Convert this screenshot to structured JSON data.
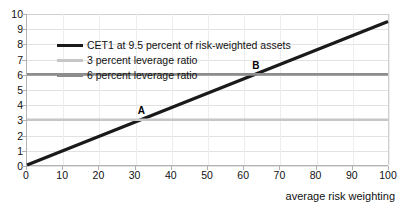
{
  "chart_data": {
    "type": "line",
    "title": "",
    "xlabel": "average risk weighting",
    "ylabel": "",
    "xlim": [
      0,
      100
    ],
    "ylim": [
      0,
      10
    ],
    "xticks": [
      0,
      10,
      20,
      30,
      40,
      50,
      60,
      70,
      80,
      90,
      100
    ],
    "yticks": [
      0,
      1,
      2,
      3,
      4,
      5,
      6,
      7,
      8,
      9,
      10
    ],
    "xtick_labels": [
      "0",
      "10",
      "20",
      "30",
      "40",
      "50",
      "60",
      "70",
      "80",
      "90",
      "100"
    ],
    "ytick_labels": [
      "0",
      "1",
      "2",
      "3",
      "4",
      "5",
      "6",
      "7",
      "8",
      "9",
      "10"
    ],
    "grid": true,
    "legend_position": "upper-left",
    "series": [
      {
        "name": "CET1 at 9.5 percent of risk-weighted assets",
        "color": "#1a1a1a",
        "width": 3.2,
        "kind": "diagonal",
        "slope": 0.095,
        "intercept": 0,
        "x": [
          0,
          100
        ],
        "values": [
          0,
          9.5
        ]
      },
      {
        "name": "3 percent leverage ratio",
        "color": "#c6c6c6",
        "width": 2.6,
        "kind": "horizontal",
        "level": 3,
        "x": [
          0,
          100
        ],
        "values": [
          3,
          3
        ]
      },
      {
        "name": "6 percent leverage ratio",
        "color": "#8d8d8d",
        "width": 2.6,
        "kind": "horizontal",
        "level": 6,
        "x": [
          0,
          100
        ],
        "values": [
          6,
          6
        ]
      }
    ],
    "annotations": [
      {
        "label": "A",
        "x": 31.6,
        "y": 3
      },
      {
        "label": "B",
        "x": 63.2,
        "y": 6
      }
    ]
  },
  "colors": {
    "series_cet1": "#1a1a1a",
    "series_leverage_3": "#c6c6c6",
    "series_leverage_6": "#8d8d8d",
    "axis": "#b3b3b3",
    "gridline": "#e2e2e2",
    "text": "#111111",
    "background": "#ffffff"
  }
}
